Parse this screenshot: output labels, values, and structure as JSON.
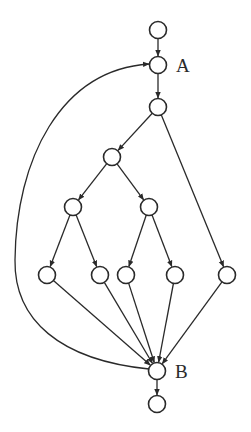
{
  "diagram": {
    "type": "directed-graph",
    "stroke_color": "#2a2a2a",
    "background": "#ffffff",
    "node_radius": 8.5,
    "nodes": [
      {
        "id": "n0",
        "x": 158,
        "y": 30,
        "label": ""
      },
      {
        "id": "A",
        "x": 158,
        "y": 65,
        "label": "A"
      },
      {
        "id": "n2",
        "x": 158,
        "y": 107,
        "label": ""
      },
      {
        "id": "n3",
        "x": 112,
        "y": 157,
        "label": ""
      },
      {
        "id": "n4",
        "x": 73,
        "y": 207,
        "label": ""
      },
      {
        "id": "n5",
        "x": 149,
        "y": 207,
        "label": ""
      },
      {
        "id": "n6",
        "x": 47,
        "y": 275,
        "label": ""
      },
      {
        "id": "n7",
        "x": 100,
        "y": 275,
        "label": ""
      },
      {
        "id": "n8",
        "x": 126,
        "y": 275,
        "label": ""
      },
      {
        "id": "n9",
        "x": 175,
        "y": 275,
        "label": ""
      },
      {
        "id": "n10",
        "x": 227,
        "y": 275,
        "label": ""
      },
      {
        "id": "B",
        "x": 157,
        "y": 371,
        "label": "B"
      },
      {
        "id": "n12",
        "x": 157,
        "y": 404,
        "label": ""
      }
    ],
    "edges": [
      {
        "from": "n0",
        "to": "A"
      },
      {
        "from": "A",
        "to": "n2"
      },
      {
        "from": "n2",
        "to": "n3"
      },
      {
        "from": "n2",
        "to": "n10"
      },
      {
        "from": "n3",
        "to": "n4"
      },
      {
        "from": "n3",
        "to": "n5"
      },
      {
        "from": "n4",
        "to": "n6"
      },
      {
        "from": "n4",
        "to": "n7"
      },
      {
        "from": "n5",
        "to": "n8"
      },
      {
        "from": "n5",
        "to": "n9"
      },
      {
        "from": "n6",
        "to": "B"
      },
      {
        "from": "n7",
        "to": "B"
      },
      {
        "from": "n8",
        "to": "B"
      },
      {
        "from": "n9",
        "to": "B"
      },
      {
        "from": "n10",
        "to": "B"
      },
      {
        "from": "B",
        "to": "n12"
      },
      {
        "from": "B",
        "to": "A",
        "curved": true
      }
    ],
    "labels": {
      "A": "A",
      "B": "B"
    }
  }
}
